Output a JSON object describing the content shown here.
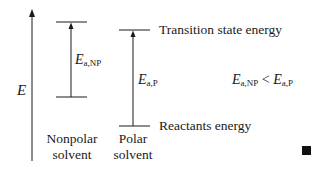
{
  "axis": {
    "label": "E",
    "direction": "up"
  },
  "columns": [
    {
      "id": "nonpolar",
      "label_line1": "Nonpolar",
      "label_line2": "solvent",
      "ea_symbol": "E",
      "ea_subscript": "a,NP"
    },
    {
      "id": "polar",
      "label_line1": "Polar",
      "label_line2": "solvent",
      "ea_symbol": "E",
      "ea_subscript": "a,P"
    }
  ],
  "levels": {
    "transition_state": "Transition state energy",
    "reactants": "Reactants energy"
  },
  "relation": {
    "left_symbol": "E",
    "left_subscript": "a,NP",
    "operator": "<",
    "right_symbol": "E",
    "right_subscript": "a,P"
  },
  "colors": {
    "line": "#1a1a1a",
    "end_mark": "#111111"
  }
}
